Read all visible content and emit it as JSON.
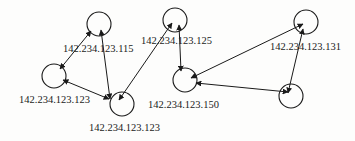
{
  "diagram": {
    "title": "",
    "nodes": [
      {
        "id": "n115",
        "cx": 99,
        "cy": 24,
        "r": 12,
        "label": "142.234.123.115",
        "label_x": 63,
        "label_y": 52
      },
      {
        "id": "n123a",
        "cx": 54,
        "cy": 76,
        "r": 12,
        "label": "142.234.123.123",
        "label_x": 19,
        "label_y": 103
      },
      {
        "id": "n123b",
        "cx": 122,
        "cy": 104,
        "r": 12,
        "label": "142.234.123.123",
        "label_x": 89,
        "label_y": 131
      },
      {
        "id": "n125",
        "cx": 175,
        "cy": 20,
        "r": 12,
        "label": "142.234.123.125",
        "label_x": 141,
        "label_y": 44
      },
      {
        "id": "n150",
        "cx": 185,
        "cy": 80,
        "r": 12,
        "label": "142.234.123.150",
        "label_x": 148,
        "label_y": 108
      },
      {
        "id": "n131",
        "cx": 306,
        "cy": 22,
        "r": 12,
        "label": "142.234.123.131",
        "label_x": 270,
        "label_y": 50
      },
      {
        "id": "nX",
        "cx": 291,
        "cy": 96,
        "r": 12,
        "label": "",
        "label_x": 0,
        "label_y": 0
      }
    ],
    "edges": [
      {
        "from": "n115",
        "to": "n123a",
        "x1": 91,
        "y1": 31,
        "x2": 60,
        "y2": 69,
        "directed": "both"
      },
      {
        "from": "n115",
        "to": "n123b",
        "x1": 101,
        "y1": 30,
        "x2": 110,
        "y2": 99,
        "directed": "both"
      },
      {
        "from": "n123a",
        "to": "n123b",
        "x1": 63,
        "y1": 80,
        "x2": 109,
        "y2": 99,
        "directed": "both"
      },
      {
        "from": "n123b",
        "to": "n125",
        "x1": 119,
        "y1": 100,
        "x2": 172,
        "y2": 23,
        "directed": "both"
      },
      {
        "from": "n125",
        "to": "n150",
        "x1": 179,
        "y1": 25,
        "x2": 181,
        "y2": 71,
        "directed": "both"
      },
      {
        "from": "n150",
        "to": "n131",
        "x1": 191,
        "y1": 78,
        "x2": 303,
        "y2": 24,
        "directed": "both"
      },
      {
        "from": "n150",
        "to": "nX",
        "x1": 196,
        "y1": 83,
        "x2": 288,
        "y2": 92,
        "directed": "both"
      },
      {
        "from": "n131",
        "to": "nX",
        "x1": 303,
        "y1": 29,
        "x2": 288,
        "y2": 93,
        "directed": "both"
      }
    ],
    "colors": {
      "stroke": "#1a1a1a",
      "text": "#222222",
      "background": "#fdfdfc"
    }
  }
}
